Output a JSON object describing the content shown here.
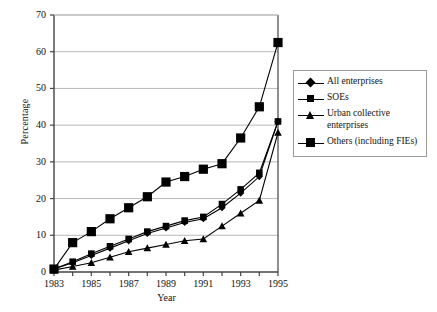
{
  "chart_data": {
    "type": "line",
    "title": "",
    "xlabel": "Year",
    "ylabel": "Percentage",
    "xlim": [
      1983,
      1995
    ],
    "ylim": [
      0,
      70
    ],
    "ytick_labels": [
      "0",
      "10",
      "20",
      "30",
      "40",
      "50",
      "60",
      "70"
    ],
    "ytick_values": [
      0,
      10,
      20,
      30,
      40,
      50,
      60,
      70
    ],
    "xtick_labels": [
      "1983",
      "1985",
      "1987",
      "1989",
      "1991",
      "1993",
      "1995"
    ],
    "xtick_values": [
      1983,
      1985,
      1987,
      1989,
      1991,
      1993,
      1995
    ],
    "x": [
      1983,
      1984,
      1985,
      1986,
      1987,
      1988,
      1989,
      1990,
      1991,
      1992,
      1993,
      1994,
      1995
    ],
    "grid": true,
    "legend_position": "right",
    "series": [
      {
        "name": "All enterprises",
        "marker": "diamond",
        "values": [
          0.8,
          2.5,
          4.5,
          6.5,
          8.5,
          10.5,
          12.0,
          13.5,
          14.5,
          17.5,
          21.5,
          26.0,
          41.0
        ]
      },
      {
        "name": "SOEs",
        "marker": "square-small",
        "values": [
          0.8,
          2.8,
          5.0,
          7.0,
          9.0,
          11.0,
          12.5,
          14.0,
          15.0,
          18.5,
          22.5,
          27.0,
          41.0
        ]
      },
      {
        "name": "Urban collective\nenterprises",
        "marker": "triangle",
        "values": [
          0.5,
          1.5,
          2.5,
          4.0,
          5.5,
          6.5,
          7.5,
          8.5,
          9.0,
          12.5,
          16.0,
          19.5,
          38.0
        ]
      },
      {
        "name": "Others (including FIEs)",
        "marker": "square-large",
        "values": [
          0.8,
          8.0,
          11.0,
          14.5,
          17.5,
          20.5,
          24.5,
          26.0,
          28.0,
          29.5,
          36.5,
          45.0,
          62.5
        ]
      }
    ]
  },
  "axes": {
    "ylabel": "Percentage",
    "xlabel": "Year"
  },
  "legend": {
    "entries": [
      {
        "label": "All enterprises",
        "marker": "diamond-icon"
      },
      {
        "label": "SOEs",
        "marker": "square-small-icon"
      },
      {
        "label": "Urban collective\nenterprises",
        "marker": "triangle-icon"
      },
      {
        "label": "Others (including FIEs)",
        "marker": "square-large-icon"
      }
    ]
  }
}
